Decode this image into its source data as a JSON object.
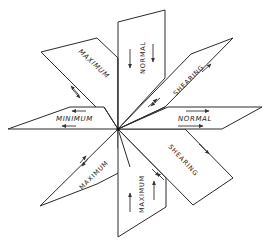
{
  "diagram": {
    "title": "",
    "center": {
      "x": 118,
      "y": 129
    },
    "planes": [
      {
        "id": "upper-left",
        "label": "MAXIMUM",
        "stress": "maximum shear",
        "arrows": "shear pair"
      },
      {
        "id": "upper-vertical",
        "label": "NORMAL",
        "stress": "normal",
        "arrows": "downward pair"
      },
      {
        "id": "upper-right",
        "label": "SHEARING",
        "stress": "shearing",
        "arrows": "shear pair"
      },
      {
        "id": "right-horizontal",
        "label": "NORMAL",
        "stress": "normal",
        "arrows": "rightward pair"
      },
      {
        "id": "lower-right",
        "label": "SHEARING",
        "stress": "shearing",
        "arrows": "shear pair"
      },
      {
        "id": "lower-vertical",
        "label": "MAXIMUM",
        "stress": "maximum normal",
        "arrows": "upward pair"
      },
      {
        "id": "lower-left",
        "label": "MAXIMUM",
        "stress": "maximum shear",
        "arrows": "shear pair"
      },
      {
        "id": "left-horizontal",
        "label": "MINIMUM",
        "stress": "minimum normal",
        "arrows": "leftward pair"
      }
    ],
    "colors": {
      "line": "#2a2a2a",
      "background": "#ffffff"
    }
  }
}
